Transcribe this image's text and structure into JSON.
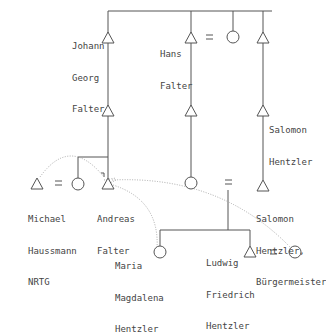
{
  "diagram": {
    "type": "genealogy-tree",
    "line_color": "#555555",
    "dotted_color": "#aaaaaa",
    "persons": {
      "johann": {
        "name_lines": [
          "Johann",
          "Georg",
          "Falter"
        ],
        "sex": "male"
      },
      "hans": {
        "name_lines": [
          "Hans",
          "Falter"
        ],
        "sex": "male"
      },
      "salomon1": {
        "name_lines": [
          "Salomon",
          "Hentzler"
        ],
        "sex": "male"
      },
      "michael": {
        "name_lines": [
          "Michael",
          "Haussmann",
          "NRTG"
        ],
        "sex": "male"
      },
      "andreas": {
        "name_lines": [
          "Andreas",
          "Falter"
        ],
        "sex": "male"
      },
      "salomon2": {
        "name_lines": [
          "Salomon",
          "Hentzler,",
          "Bürgermeister"
        ],
        "sex": "male"
      },
      "maria": {
        "name_lines": [
          "Maria",
          "Magdalena",
          "Hentzler"
        ],
        "sex": "female"
      },
      "ludwig": {
        "name_lines": [
          "Ludwig",
          "Friedrich",
          "Hentzler"
        ],
        "sex": "male"
      }
    },
    "marriage_symbol": "="
  }
}
